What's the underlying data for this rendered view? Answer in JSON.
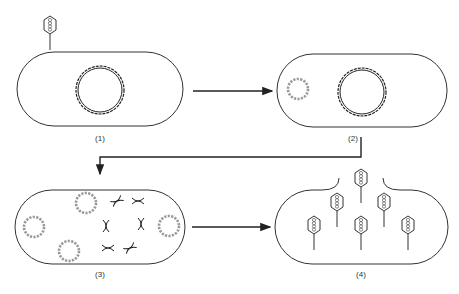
{
  "diagram": {
    "panels": [
      {
        "id": 1,
        "label": "(1)",
        "content": "phage attached to bacterial cell with circular chromosome"
      },
      {
        "id": 2,
        "label": "(2)",
        "content": "phage DNA injected, circular phage genome beside bacterial chromosome"
      },
      {
        "id": 3,
        "label": "(3)",
        "content": "phage genomes replicated, bacterial chromosome fragmented"
      },
      {
        "id": 4,
        "label": "(4)",
        "content": "new phages assembled, cell lyses releasing phages"
      }
    ],
    "colors": {
      "line": "#222222",
      "phage_dna": "#888888",
      "background": "#ffffff"
    }
  }
}
